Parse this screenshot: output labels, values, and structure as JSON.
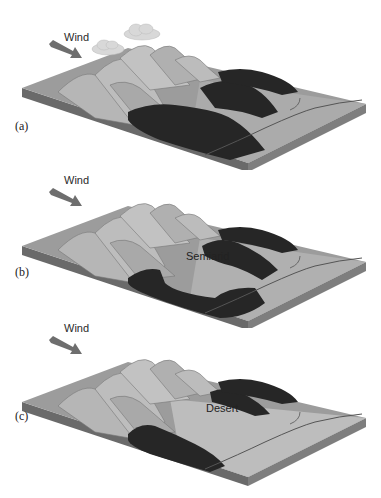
{
  "figure": {
    "panels": [
      {
        "id": "a",
        "label": "(a)",
        "wind_label": "Wind",
        "region_label": "",
        "has_clouds": true,
        "forest": "dense forest covering lee side and valleys"
      },
      {
        "id": "b",
        "label": "(b)",
        "wind_label": "Wind",
        "region_label": "Semiarid",
        "has_clouds": false,
        "forest": "forest patches around semiarid core"
      },
      {
        "id": "c",
        "label": "(c)",
        "wind_label": "Wind",
        "region_label": "Desert",
        "has_clouds": false,
        "forest": "sparse forest strips bordering desert"
      }
    ]
  },
  "colors": {
    "surface": "#9a9a9a",
    "surface_light": "#b8b8b8",
    "side_front": "#6a6a6a",
    "side_right": "#7e7e7e",
    "mountain": "#b4b4b4",
    "mountain_shade": "#8c8c8c",
    "forest": "#262626",
    "arrow": "#6e6e6e",
    "river": "#555555",
    "cloud": "#d8d8d8"
  }
}
